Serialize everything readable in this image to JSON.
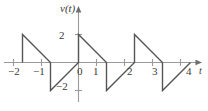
{
  "figure": {
    "name": "sawtooth-waveform-plot",
    "background_color": "#ffffff",
    "line_color": "#4a4a4a",
    "axis_color": "#8a8a8a",
    "text_color": "#3a3a3a"
  },
  "axes": {
    "vertical_axis_label": "v(t)",
    "horizontal_axis_label": "t",
    "y_ticks": [
      {
        "value": 2,
        "label": "2"
      },
      {
        "value": -2,
        "label": "−2"
      }
    ],
    "x_ticks": [
      {
        "value": -2,
        "label": "−2"
      },
      {
        "value": -1,
        "label": "−1"
      },
      {
        "value": 0,
        "label": "0"
      },
      {
        "value": 1,
        "label": "1"
      },
      {
        "value": 2,
        "label": "2"
      },
      {
        "value": 3,
        "label": "3"
      },
      {
        "value": 4,
        "label": "4"
      }
    ]
  },
  "chart_data": {
    "type": "line",
    "title": "",
    "xlabel": "t",
    "ylabel": "v(t)",
    "xlim": [
      -2.6,
      4.6
    ],
    "ylim": [
      -2.6,
      2.6
    ],
    "grid": false,
    "legend": null,
    "period": 2,
    "amplitude_peak": 2,
    "amplitude_peak_to_peak": 4,
    "slope": -2,
    "series": [
      {
        "name": "v(t)",
        "points": [
          {
            "t": -2,
            "v": 0
          },
          {
            "t": -2,
            "v": 2
          },
          {
            "t": -1,
            "v": 0
          },
          {
            "t": -1,
            "v": -2
          },
          {
            "t": 0,
            "v": 0
          },
          {
            "t": 0,
            "v": 2
          },
          {
            "t": 1,
            "v": 0
          },
          {
            "t": 1,
            "v": -2
          },
          {
            "t": 2,
            "v": 0
          },
          {
            "t": 2,
            "v": 2
          },
          {
            "t": 3,
            "v": 0
          },
          {
            "t": 3,
            "v": -2
          },
          {
            "t": 4,
            "v": 0
          }
        ]
      }
    ]
  }
}
